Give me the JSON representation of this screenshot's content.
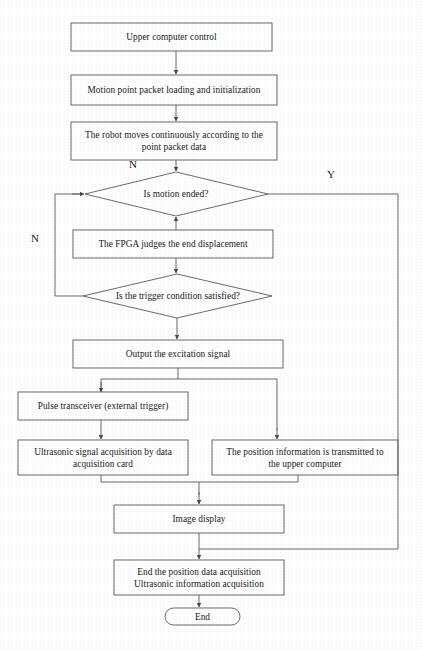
{
  "diagram": {
    "type": "flowchart",
    "background_color": "#ffffff",
    "stroke_color": "#555555",
    "text_color": "#1a1a1a"
  },
  "nodes": [
    {
      "id": "n1",
      "shape": "process",
      "label": "Upper computer control"
    },
    {
      "id": "n2",
      "shape": "process",
      "label": "Motion point packet loading and initialization"
    },
    {
      "id": "n3",
      "shape": "process",
      "label": "The robot moves continuously according to the\npoint packet data"
    },
    {
      "id": "n4",
      "shape": "decision",
      "label": "Is motion ended?"
    },
    {
      "id": "n5",
      "shape": "process",
      "label": "The FPGA  judges the end displacement"
    },
    {
      "id": "n6",
      "shape": "decision",
      "label": "Is the trigger condition satisfied?"
    },
    {
      "id": "n7",
      "shape": "process",
      "label": "Output the excitation signal"
    },
    {
      "id": "n8",
      "shape": "process",
      "label": "Pulse transceiver (external trigger)"
    },
    {
      "id": "n9",
      "shape": "process",
      "label": "Ultrasonic signal acquisition by data\nacquisition card"
    },
    {
      "id": "n10",
      "shape": "process",
      "label": "The position information is transmitted to\nthe upper computer"
    },
    {
      "id": "n11",
      "shape": "process",
      "label": "Image display"
    },
    {
      "id": "n12",
      "shape": "process",
      "label": "End the position data acquisition\nUltrasonic information acquisition"
    },
    {
      "id": "n13",
      "shape": "terminator",
      "label": "End"
    }
  ],
  "branch_labels": [
    {
      "id": "b1",
      "label": "N",
      "for_node": "n4",
      "position": "top-left"
    },
    {
      "id": "b2",
      "label": "Y",
      "for_node": "n4",
      "position": "right"
    },
    {
      "id": "b3",
      "label": "N",
      "for_node": "n6",
      "position": "left"
    }
  ],
  "edges": [
    {
      "from": "n1",
      "to": "n2",
      "label": ""
    },
    {
      "from": "n2",
      "to": "n3",
      "label": ""
    },
    {
      "from": "n3",
      "to": "n4",
      "label": ""
    },
    {
      "from": "n4",
      "to": "n13",
      "label": "Y"
    },
    {
      "from": "n5",
      "to": "n4",
      "label": ""
    },
    {
      "from": "n5",
      "to": "n6",
      "label": ""
    },
    {
      "from": "n6",
      "to": "n4",
      "label": "N"
    },
    {
      "from": "n6",
      "to": "n7",
      "label": ""
    },
    {
      "from": "n7",
      "to": "n8",
      "label": ""
    },
    {
      "from": "n7",
      "to": "n10",
      "label": ""
    },
    {
      "from": "n8",
      "to": "n9",
      "label": ""
    },
    {
      "from": "n9",
      "to": "n11",
      "label": ""
    },
    {
      "from": "n10",
      "to": "n11",
      "label": ""
    },
    {
      "from": "n11",
      "to": "n12",
      "label": ""
    },
    {
      "from": "n12",
      "to": "n13",
      "label": ""
    }
  ]
}
